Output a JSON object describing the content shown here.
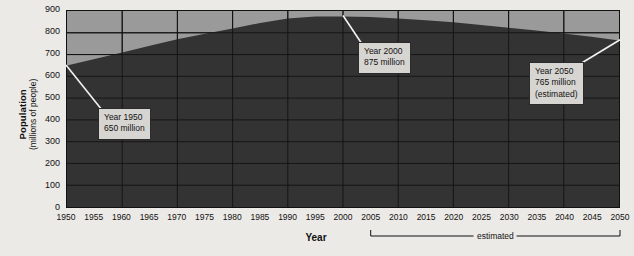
{
  "chart_data": {
    "type": "area",
    "title": "",
    "xlabel": "Year",
    "ylabel": "Population",
    "ylabel_sub": "(millions of people)",
    "xlim": [
      1950,
      2050
    ],
    "ylim": [
      0,
      900
    ],
    "grid": true,
    "legend": false,
    "x_ticks": [
      "1950",
      "1955",
      "1960",
      "1965",
      "1970",
      "1975",
      "1980",
      "1985",
      "1990",
      "1995",
      "2000",
      "2005",
      "2010",
      "2015",
      "2020",
      "2025",
      "2030",
      "2035",
      "2040",
      "2045",
      "2050"
    ],
    "y_ticks": [
      "0",
      "100",
      "200",
      "300",
      "400",
      "500",
      "600",
      "700",
      "800",
      "900"
    ],
    "x": [
      1950,
      1955,
      1960,
      1965,
      1970,
      1975,
      1980,
      1985,
      1990,
      1995,
      2000,
      2005,
      2010,
      2015,
      2020,
      2025,
      2030,
      2035,
      2040,
      2045,
      2050
    ],
    "values": [
      650,
      680,
      710,
      740,
      770,
      795,
      820,
      845,
      865,
      875,
      875,
      872,
      866,
      858,
      848,
      836,
      823,
      810,
      797,
      782,
      765
    ],
    "series": [
      {
        "name": "Population",
        "values": [
          650,
          680,
          710,
          740,
          770,
          795,
          820,
          845,
          865,
          875,
          875,
          872,
          866,
          858,
          848,
          836,
          823,
          810,
          797,
          782,
          765
        ]
      }
    ],
    "annotations": [
      {
        "id": "year-1950",
        "lines": [
          "Year 1950",
          "650 million"
        ],
        "point_x": 1950,
        "point_y": 650,
        "box_left": 98,
        "box_top": 108
      },
      {
        "id": "year-2000",
        "lines": [
          "Year 2000",
          "875 million"
        ],
        "point_x": 2000,
        "point_y": 875,
        "box_left": 358,
        "box_top": 42
      },
      {
        "id": "year-2050",
        "lines": [
          "Year 2050",
          "765 million",
          "(estimated)"
        ],
        "point_x": 2050,
        "point_y": 765,
        "box_left": 529,
        "box_top": 62
      }
    ],
    "estimated_bracket": {
      "label": "estimated",
      "from_year": 2005,
      "to_year": 2050
    },
    "colors": {
      "background": "#eceae6",
      "plot_above_curve": "#9a9a9a",
      "area_fill": "#333333",
      "grid_line": "#111111",
      "axis_line": "#111111",
      "callout_fill": "#d7d5d1",
      "callout_border": "#2b2b2b"
    }
  }
}
